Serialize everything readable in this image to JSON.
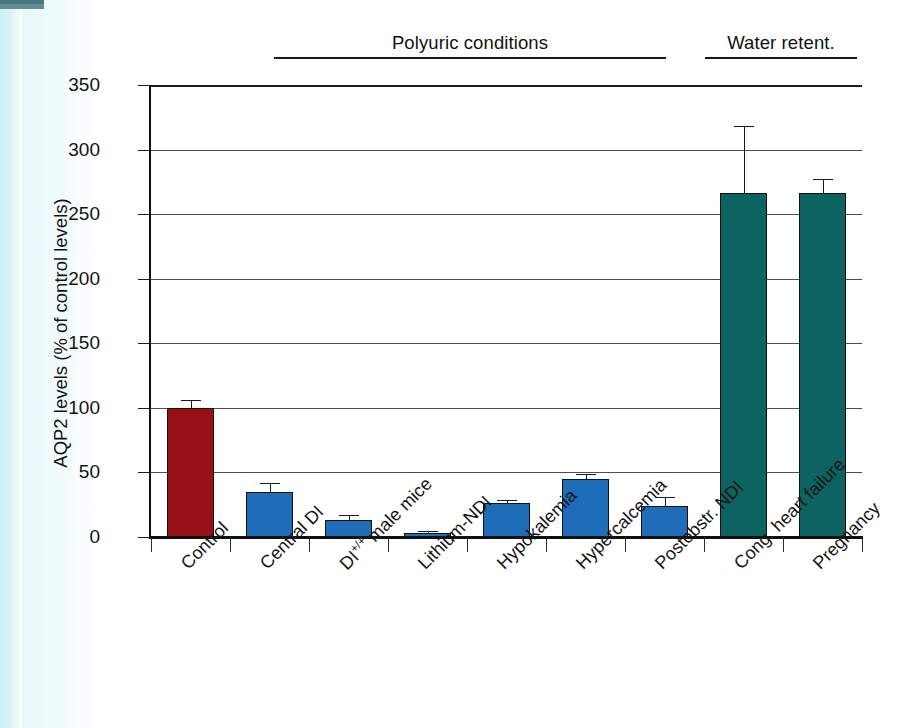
{
  "chart_data": {
    "type": "bar",
    "title": "",
    "xlabel": "",
    "ylabel": "AQP2 levels (% of control levels)",
    "ylim": [
      0,
      350
    ],
    "yticks": [
      0,
      50,
      100,
      150,
      200,
      250,
      300,
      350
    ],
    "grid": true,
    "legend": null,
    "categories": [
      "Control",
      "Central DI",
      "DI +/+ male mice",
      "Lithium-NDI",
      "Hypokalemia",
      "Hypercalcemia",
      "Postobstr. NDI",
      "Cong. heart failure",
      "Pregnancy"
    ],
    "values": [
      100,
      35,
      13,
      3,
      26,
      45,
      24,
      266,
      266
    ],
    "errors": [
      6,
      7,
      4,
      2,
      3,
      4,
      7,
      52,
      11
    ],
    "bar_colors": [
      "#991118",
      "#1f6cb8",
      "#1f6cb8",
      "#1f6cb8",
      "#1f6cb8",
      "#1f6cb8",
      "#1f6cb8",
      "#0d6360",
      "#0d6360"
    ],
    "annotations": [
      {
        "label": "Polyuric conditions",
        "from_index": 1,
        "to_index": 6
      },
      {
        "label": "Water retent.",
        "from_index": 7,
        "to_index": 8
      }
    ]
  },
  "axis": {
    "y_label": "AQP2 levels (% of control levels)",
    "y_tick_labels": [
      "350",
      "300",
      "250",
      "200",
      "150",
      "100",
      "50",
      "0"
    ]
  },
  "categories": {
    "c0": "Control",
    "c1": "Central DI",
    "c2_prefix": "DI",
    "c2_sup": "+/+",
    "c2_suffix": " male mice",
    "c3": "Lithium-NDI",
    "c4": "Hypokalemia",
    "c5": "Hypercalcemia",
    "c6": "Postobstr. NDI",
    "c7": "Cong. heart failure",
    "c8": "Pregnancy"
  },
  "groups": {
    "polyuric": "Polyuric conditions",
    "water": "Water retent."
  },
  "colors": {
    "control_red": "#991118",
    "polyuric_blue": "#1f6cb8",
    "retention_teal": "#0d6360",
    "axis_black": "#111111",
    "grid_gray": "#4e4e4e"
  }
}
